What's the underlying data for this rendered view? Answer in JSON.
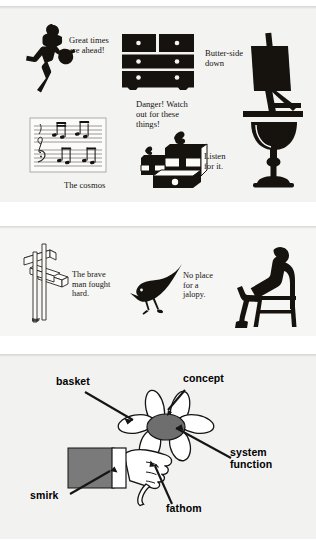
{
  "document": {
    "type": "scanned-clipart-page",
    "background_color": "#ffffff",
    "panel_color": "#f3f3f2",
    "ink_color": "#16130f"
  },
  "panels": [
    {
      "id": "panel-1",
      "name": "clipart-panel-top",
      "items": [
        {
          "name": "bowler-silhouette",
          "icon": "bowling-figure-icon",
          "caption": "Great times\nare ahead!"
        },
        {
          "name": "dresser-silhouette",
          "icon": "dresser-icon",
          "caption": "Danger!  Watch\nout for these\nthings!"
        },
        {
          "name": "easel-silhouette",
          "icon": "easel-icon",
          "caption": "Butter-side\ndown"
        },
        {
          "name": "sheet-music",
          "icon": "music-staff-icon",
          "caption": "The cosmos"
        },
        {
          "name": "gift-boxes",
          "icon": "gift-boxes-icon",
          "caption": ""
        },
        {
          "name": "goblet-silhouette",
          "icon": "goblet-icon",
          "caption": "Listen\nfor it."
        }
      ],
      "captions": {
        "bowler": "Great times are ahead!",
        "bowler_line1": "Great times",
        "bowler_line2": "are ahead!",
        "dresser_line1": "Danger!  Watch",
        "dresser_line2": "out for these",
        "dresser_line3": "things!",
        "easel_line1": "Butter-side",
        "easel_line2": "down",
        "music": "The cosmos",
        "goblet_line1": "Listen",
        "goblet_line2": "for it."
      }
    },
    {
      "id": "panel-2",
      "name": "clipart-panel-middle",
      "captions": {
        "signpost_line1": "The brave",
        "signpost_line2": "man fought",
        "signpost_line3": "hard.",
        "bird_line1": "No place",
        "bird_line2": "for a",
        "bird_line3": "jalopy."
      },
      "items": [
        {
          "name": "signpost-outline",
          "icon": "signpost-icon"
        },
        {
          "name": "bird-silhouette",
          "icon": "bird-icon"
        },
        {
          "name": "seated-person-silhouette",
          "icon": "seated-person-icon"
        }
      ]
    },
    {
      "id": "panel-3",
      "name": "labeled-diagram-panel",
      "subject": "hand-holding-flower",
      "labels": [
        {
          "name": "label-basket",
          "text": "basket",
          "target": "flower-petal-left"
        },
        {
          "name": "label-concept",
          "text": "concept",
          "target": "flower-petal-top"
        },
        {
          "name": "label-system-function",
          "text_line1": "system",
          "text_line2": "function",
          "target": "flower-center"
        },
        {
          "name": "label-smirk",
          "text": "smirk",
          "target": "sleeve-cuff"
        },
        {
          "name": "label-fathom",
          "text": "fathom",
          "target": "thumb-nail"
        }
      ],
      "colors": {
        "sleeve": "#7a7a7a",
        "flower_center": "#6e6e6e",
        "outline": "#151515"
      }
    }
  ]
}
